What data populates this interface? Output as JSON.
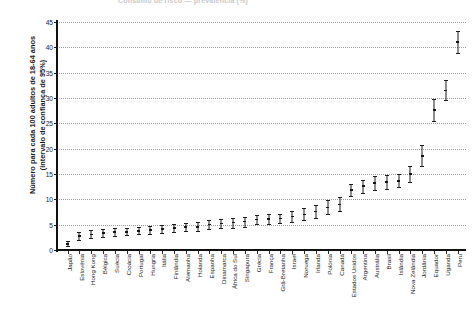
{
  "figure": {
    "title_cutoff": "Consumo de risco — prevalência (%)",
    "ylabel_line1": "Número para cada 100 adultos de 18-64 anos",
    "ylabel_line2": "(intervalo de confiança de 95%)"
  },
  "chart_data": {
    "type": "scatter",
    "title": "",
    "xlabel": "",
    "ylabel": "Número para cada 100 adultos de 18-64 anos (intervalo de confiança de 95%)",
    "ylim": [
      0,
      45
    ],
    "ytick_labels": [
      "0",
      "5",
      "10",
      "15",
      "20",
      "25",
      "30",
      "35",
      "40",
      "45"
    ],
    "yticks": [
      0,
      5,
      10,
      15,
      20,
      25,
      30,
      35,
      40,
      45
    ],
    "grid": true,
    "legend": "none",
    "error_bars": "95% confidence interval",
    "categories": [
      "Japão",
      "Eslovénia",
      "Hong Kong",
      "Bélgica",
      "Suécia",
      "Croácia",
      "Portugal",
      "Hungria",
      "Itália",
      "Finlândia",
      "Alemanha",
      "Holanda",
      "Espanha",
      "Dinamarca",
      "África do Sul",
      "Singapura",
      "Grécia",
      "França",
      "Grã-Bretanha",
      "Israel",
      "Noruega",
      "Irlanda",
      "Polónia",
      "Canadá",
      "Estados Unidos",
      "Argentina",
      "Austrália",
      "Brasil",
      "Islândia",
      "Nova Zelândia",
      "Jordânia",
      "Equador",
      "Uganda",
      "Peru"
    ],
    "values": [
      1.2,
      2.8,
      3.1,
      3.3,
      3.5,
      3.6,
      3.8,
      4.0,
      4.2,
      4.3,
      4.5,
      4.6,
      5.0,
      5.2,
      5.4,
      5.6,
      6.0,
      6.1,
      6.2,
      6.6,
      7.0,
      7.6,
      8.4,
      9.0,
      11.8,
      12.6,
      13.2,
      13.4,
      13.6,
      15.0,
      18.6,
      27.6,
      31.5,
      41.0
    ],
    "ci_low": [
      0.8,
      2.0,
      2.4,
      2.6,
      2.8,
      2.9,
      3.1,
      3.2,
      3.4,
      3.5,
      3.7,
      3.8,
      4.2,
      4.3,
      4.4,
      4.6,
      5.1,
      5.2,
      5.4,
      5.6,
      5.9,
      6.4,
      7.1,
      7.7,
      10.6,
      11.3,
      11.9,
      12.1,
      12.4,
      13.5,
      16.6,
      25.5,
      29.6,
      38.8
    ],
    "ci_high": [
      1.7,
      3.6,
      3.9,
      4.1,
      4.3,
      4.4,
      4.6,
      4.8,
      5.0,
      5.2,
      5.4,
      5.5,
      5.9,
      6.1,
      6.4,
      6.6,
      7.0,
      7.1,
      7.2,
      7.7,
      8.2,
      8.9,
      9.8,
      10.4,
      13.1,
      13.9,
      14.6,
      14.8,
      15.0,
      16.5,
      20.7,
      29.8,
      33.5,
      43.3
    ]
  }
}
